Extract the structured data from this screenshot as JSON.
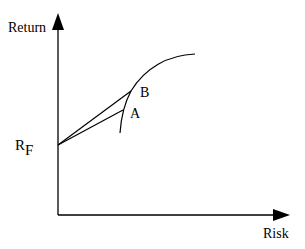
{
  "diagram": {
    "type": "capital market line / efficient frontier",
    "y_axis_label": "Return",
    "x_axis_label": "Risk",
    "risk_free_label": "R",
    "risk_free_subscript": "F",
    "points": [
      {
        "label": "A"
      },
      {
        "label": "B"
      }
    ],
    "colors": {
      "line": "#000000",
      "background": "#ffffff"
    }
  }
}
